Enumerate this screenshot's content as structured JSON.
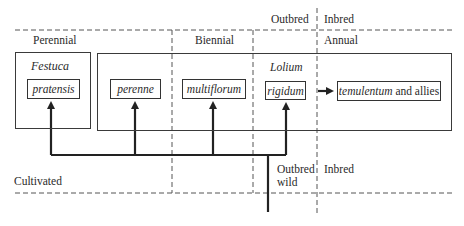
{
  "regions": {
    "outbred_top": "Outbred",
    "inbred_top": "Inbred",
    "perennial": "Perennial",
    "biennial": "Biennial",
    "annual": "Annual",
    "cultivated": "Cultivated",
    "outbred_wild_line1": "Outbred",
    "outbred_wild_line2": "wild",
    "inbred_bottom": "Inbred"
  },
  "genera": {
    "festuca": "Festuca",
    "lolium": "Lolium"
  },
  "species": {
    "pratensis": "pratensis",
    "perenne": "perenne",
    "multiflorum": "multiflorum",
    "rigidum": "rigidum",
    "temulentum": "temulentum",
    "temulentum_suffix": " and allies"
  },
  "colors": {
    "line": "#333333",
    "background": "#ffffff"
  }
}
